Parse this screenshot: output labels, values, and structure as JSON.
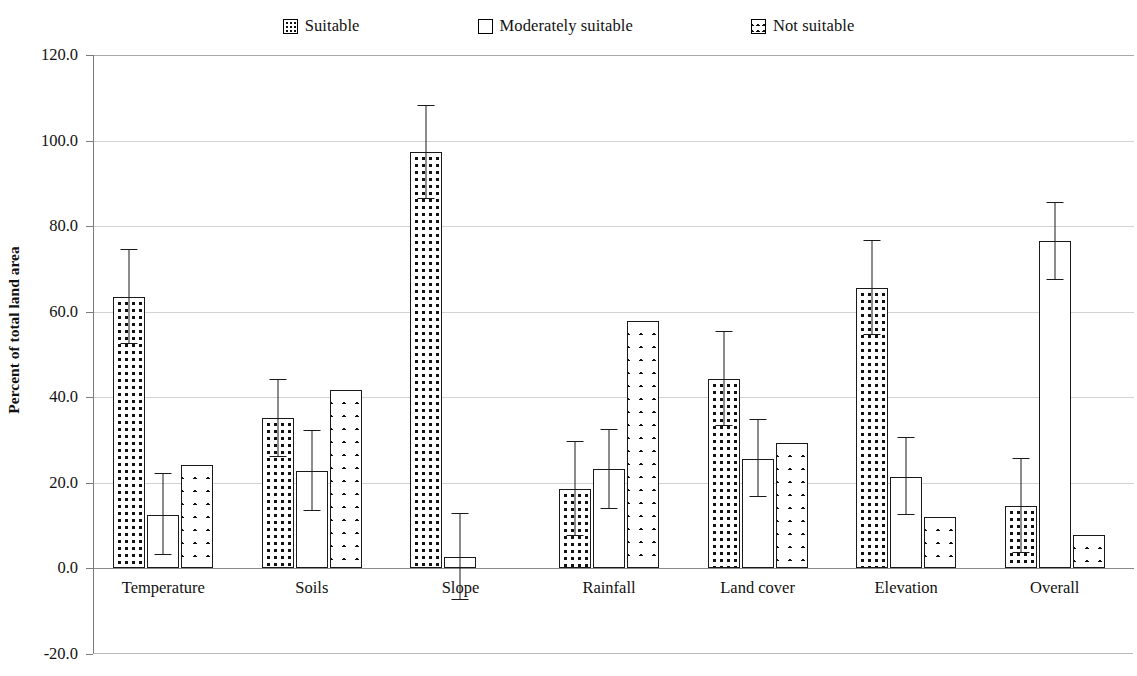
{
  "chart_data": {
    "type": "bar",
    "title": "",
    "xlabel": "",
    "ylabel": "Percent of total land area",
    "ylim": [
      -20.0,
      120.0
    ],
    "ytick_labels": [
      "120.0",
      "100.0",
      "80.0",
      "60.0",
      "40.0",
      "20.0",
      "0.0",
      "-20.0"
    ],
    "ytick_values": [
      120.0,
      100.0,
      80.0,
      60.0,
      40.0,
      20.0,
      0.0,
      -20.0
    ],
    "grid": true,
    "legend_position": "top-center",
    "error_bars": "symmetric",
    "categories": [
      "Temperature",
      "Soils",
      "Slope",
      "Rainfall",
      "Land cover",
      "Elevation",
      "Overall"
    ],
    "series": [
      {
        "name": "Suitable",
        "pattern": "dotted",
        "values": [
          63.5,
          35.0,
          97.2,
          18.5,
          44.2,
          65.5,
          14.5
        ],
        "errors": [
          11.0,
          9.0,
          10.8,
          11.0,
          11.0,
          11.0,
          11.0
        ]
      },
      {
        "name": "Moderately suitable",
        "pattern": "plain",
        "values": [
          12.5,
          22.7,
          2.6,
          23.1,
          25.6,
          21.4,
          76.4
        ],
        "errors": [
          9.5,
          9.3,
          10.0,
          9.3,
          9.0,
          9.0,
          9.0
        ]
      },
      {
        "name": "Not suitable",
        "pattern": "crosshatch",
        "values": [
          24.2,
          41.6,
          0.0,
          57.8,
          29.2,
          11.9,
          7.8
        ]
      }
    ]
  },
  "legend": {
    "items": [
      {
        "label": "Suitable",
        "swatch": "dotted-square-icon"
      },
      {
        "label": "Moderately suitable",
        "swatch": "empty-square-icon"
      },
      {
        "label": "Not suitable",
        "swatch": "crosshatch-square-icon"
      }
    ]
  },
  "axis": {
    "y_title": "Percent of total land area"
  }
}
